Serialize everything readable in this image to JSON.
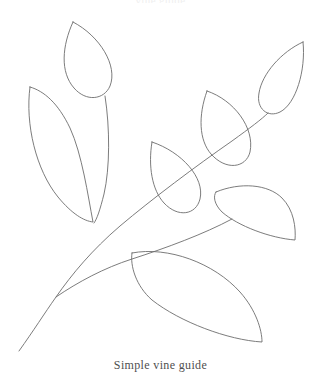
{
  "figure": {
    "title_clipped": "vine guide",
    "caption": "Simple vine guide",
    "background_color": "#ffffff",
    "line_color": "#6d6d6d",
    "line_width": 0.9,
    "canvas": {
      "width": 321,
      "height": 387
    },
    "element_count": {
      "stems": 2,
      "leaves": 7
    },
    "stems": [
      {
        "name": "main-stem",
        "description": "main vine stem rising from lower left to upper right",
        "path": "M 19 351 C 34 330 44 314 56 297 C 72 274 92 250 120 226 C 152 199 196 166 232 141 C 250 128 262 119 268 113"
      },
      {
        "name": "branch-stem",
        "description": "lower branch curving right from the junction",
        "path": "M 56 297 C 78 282 104 268 132 259 C 166 248 204 234 232 219"
      }
    ],
    "leaves": [
      {
        "name": "leaf-upper-left-teardrop",
        "position": "top",
        "tip": [
          73,
          22
        ],
        "base": [
          105,
          96
        ],
        "outline": "M 73 22 C 62 46 60 72 74 88 C 86 102 104 100 110 86 C 118 66 100 36 73 22 Z"
      },
      {
        "name": "leaf-large-left",
        "position": "upper-left",
        "tip": [
          30,
          87
        ],
        "base": [
          93,
          222
        ],
        "outline": "M 30 87 C 25 124 36 170 58 197 C 72 214 84 221 93 222 C 88 196 82 154 70 128 C 58 103 44 91 30 87 Z"
      },
      {
        "name": "leaf-left-inner-sliver",
        "position": "left-inner",
        "tip": [
          105,
          96
        ],
        "base": [
          94,
          223
        ],
        "outline": "M 105 96 C 110 128 110 168 104 194 C 100 210 97 219 94 223"
      },
      {
        "name": "leaf-middle-teardrop",
        "position": "center",
        "tip": [
          152,
          142
        ],
        "base": [
          192,
          212
        ],
        "outline": "M 152 142 C 148 166 152 190 164 203 C 178 218 196 215 200 199 C 205 178 182 152 152 142 Z"
      },
      {
        "name": "leaf-upper-middle-teardrop",
        "position": "upper-center-right",
        "tip": [
          207,
          91
        ],
        "base": [
          250,
          160
        ],
        "outline": "M 207 91 C 198 116 199 140 211 154 C 226 171 246 168 250 152 C 255 128 234 100 207 91 Z"
      },
      {
        "name": "leaf-upper-right-teardrop",
        "position": "upper-right",
        "tip": [
          303,
          42
        ],
        "base": [
          268,
          113
        ],
        "outline": "M 303 42 C 281 52 262 74 259 93 C 256 109 268 118 280 112 C 296 104 306 70 303 42 Z"
      },
      {
        "name": "leaf-right-pointing",
        "position": "mid-right",
        "tip": [
          295,
          240
        ],
        "base": [
          216,
          192
        ],
        "outline": "M 216 192 C 240 182 268 184 282 198 C 294 210 296 228 295 240 C 270 238 238 226 222 212 C 214 204 213 196 216 192 Z"
      },
      {
        "name": "leaf-large-bottom",
        "position": "bottom",
        "tip": [
          262,
          342
        ],
        "base": [
          132,
          253
        ],
        "outline": "M 132 253 C 168 246 214 263 240 292 C 256 310 262 330 262 342 C 228 340 180 322 152 300 C 136 286 130 266 132 253 Z"
      }
    ]
  }
}
